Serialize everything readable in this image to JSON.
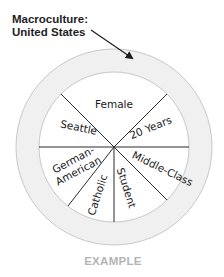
{
  "macroculture": {
    "line1": "Macroculture:",
    "line2": "United States"
  },
  "segments": [
    {
      "label": "Female"
    },
    {
      "label": "20 Years"
    },
    {
      "label": "Middle-Class"
    },
    {
      "label": "Student"
    },
    {
      "label": "Catholic"
    },
    {
      "label": "German-",
      "label2": "American"
    },
    {
      "label": "Seattle"
    }
  ],
  "caption": "EXAMPLE",
  "colors": {
    "ring_fill": "#f0f0f0",
    "ring_stroke": "#c8c8c8",
    "divider": "#2a2a2a",
    "caption": "#b4b4b4"
  }
}
